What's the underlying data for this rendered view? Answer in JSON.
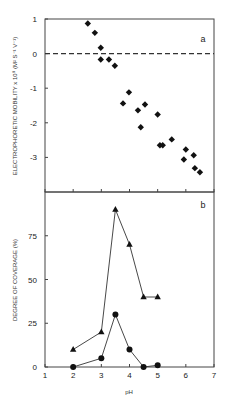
{
  "chart_data": [
    {
      "panel": "a",
      "type": "scatter",
      "title": "",
      "xlabel": "pH",
      "ylabel": "ELECTROPHORETIC MOBILITY x 10⁸ (M² S⁻¹ V⁻¹)",
      "xlim": [
        1,
        7
      ],
      "ylim": [
        -4,
        1
      ],
      "yticks": [
        1,
        0,
        -1,
        -2,
        -3
      ],
      "ytick_labels": [
        "1",
        "0",
        "-1",
        "-2",
        "-3"
      ],
      "reference_line": {
        "y": 0,
        "style": "dashed"
      },
      "marker": "diamond",
      "series": [
        {
          "name": "mobility",
          "x": [
            2.52,
            2.77,
            2.98,
            2.98,
            3.27,
            3.48,
            3.77,
            3.98,
            4.3,
            4.4,
            4.55,
            5.0,
            5.08,
            5.18,
            5.5,
            5.93,
            6.0,
            6.28,
            6.32,
            6.5
          ],
          "y": [
            0.87,
            0.6,
            0.17,
            -0.17,
            -0.17,
            -0.35,
            -1.44,
            -1.12,
            -1.64,
            -2.13,
            -1.47,
            -1.76,
            -2.65,
            -2.65,
            -2.48,
            -3.06,
            -2.77,
            -2.94,
            -3.31,
            -3.43
          ]
        }
      ],
      "annotation": "a"
    },
    {
      "panel": "b",
      "type": "line",
      "title": "",
      "xlabel": "pH",
      "ylabel": "DEGREE OF COVERAGE (%)",
      "xlim": [
        1,
        7
      ],
      "ylim": [
        0,
        100
      ],
      "xticks": [
        1,
        2,
        3,
        4,
        5,
        6,
        7
      ],
      "xtick_labels": [
        "1",
        "2",
        "3",
        "4",
        "5",
        "6",
        "7"
      ],
      "yticks": [
        0,
        25,
        50,
        75
      ],
      "ytick_labels": [
        "0",
        "25",
        "50",
        "75"
      ],
      "series": [
        {
          "name": "triangles",
          "marker": "triangle",
          "x": [
            2,
            3,
            3.5,
            4,
            4.5,
            5
          ],
          "y": [
            10,
            20,
            90,
            70,
            40,
            40
          ]
        },
        {
          "name": "circles",
          "marker": "circle",
          "x": [
            2,
            3,
            3.5,
            4,
            4.5,
            5
          ],
          "y": [
            0,
            5,
            30,
            10,
            0,
            1
          ]
        }
      ],
      "annotation": "b"
    }
  ],
  "labels": {
    "panel_a_letter": "a",
    "panel_b_letter": "b",
    "ylabel_a": "ELECTROPHORETIC MOBILITY x 10⁸ (M² S⁻¹ V⁻¹)",
    "ylabel_b": "DEGREE OF COVERAGE (%)",
    "xlabel": "pH"
  }
}
